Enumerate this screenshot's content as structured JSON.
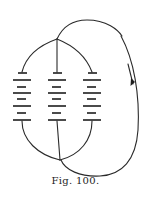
{
  "figure": {
    "caption": "Fig. 100.",
    "batteries": [
      {
        "label": "cell-1",
        "x": 22
      },
      {
        "label": "cell-2",
        "x": 57
      },
      {
        "label": "cell-3",
        "x": 92
      }
    ],
    "arrow": {
      "direction": "down"
    },
    "colors": {
      "ink": "#1e1e1e",
      "paper": "#ffffff"
    }
  }
}
